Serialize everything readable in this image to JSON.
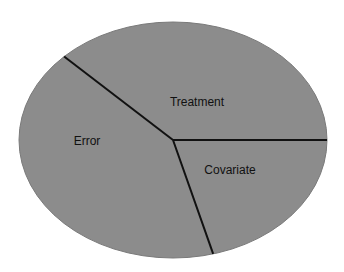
{
  "chart_data": {
    "type": "pie",
    "title": "",
    "slices": [
      {
        "label": "Treatment",
        "percent": 37.5
      },
      {
        "label": "Covariate",
        "percent": 20.8
      },
      {
        "label": "Error",
        "percent": 41.7
      }
    ],
    "fill_color": "#8c8c8c",
    "divider_color": "#111111",
    "legend": "none"
  }
}
